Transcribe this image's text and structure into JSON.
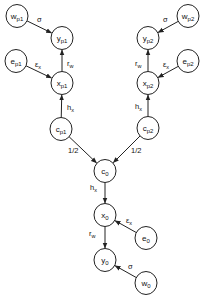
{
  "diagram": {
    "type": "directed-graph",
    "nodes": [
      {
        "id": "w_p1",
        "base": "w",
        "sub": "p1",
        "x": 17,
        "y": 16
      },
      {
        "id": "y_p1",
        "base": "y",
        "sub": "p1",
        "x": 62,
        "y": 38
      },
      {
        "id": "e_p1",
        "base": "e",
        "sub": "p1",
        "x": 16,
        "y": 61
      },
      {
        "id": "x_p1",
        "base": "x",
        "sub": "p1",
        "x": 62,
        "y": 83
      },
      {
        "id": "c_p1",
        "base": "c",
        "sub": "p1",
        "x": 61,
        "y": 129
      },
      {
        "id": "w_p2",
        "base": "w",
        "sub": "p2",
        "x": 188,
        "y": 16
      },
      {
        "id": "y_p2",
        "base": "y",
        "sub": "p2",
        "x": 148,
        "y": 38
      },
      {
        "id": "e_p2",
        "base": "e",
        "sub": "p2",
        "x": 188,
        "y": 61
      },
      {
        "id": "x_p2",
        "base": "x",
        "sub": "p2",
        "x": 148,
        "y": 83
      },
      {
        "id": "c_p2",
        "base": "c",
        "sub": "p2",
        "x": 148,
        "y": 128
      },
      {
        "id": "c_0",
        "base": "c",
        "sub": "0",
        "x": 105,
        "y": 171
      },
      {
        "id": "x_0",
        "base": "x",
        "sub": "0",
        "x": 105,
        "y": 215
      },
      {
        "id": "e_0",
        "base": "e",
        "sub": "0",
        "x": 146,
        "y": 238
      },
      {
        "id": "y_0",
        "base": "y",
        "sub": "0",
        "x": 105,
        "y": 260
      },
      {
        "id": "w_0",
        "base": "w",
        "sub": "0",
        "x": 146,
        "y": 283
      }
    ],
    "edges": [
      {
        "from": "w_p1",
        "to": "y_p1",
        "label": "σ",
        "label_sub": "",
        "lx": 37,
        "ly": 22
      },
      {
        "from": "e_p1",
        "to": "x_p1",
        "label": "ε",
        "label_sub": "x",
        "lx": 35,
        "ly": 67
      },
      {
        "from": "x_p1",
        "to": "y_p1",
        "label": "r",
        "label_sub": "w",
        "lx": 67,
        "ly": 66
      },
      {
        "from": "c_p1",
        "to": "x_p1",
        "label": "h",
        "label_sub": "x",
        "lx": 67,
        "ly": 110
      },
      {
        "from": "w_p2",
        "to": "y_p2",
        "label": "σ",
        "label_sub": "",
        "lx": 163,
        "ly": 22
      },
      {
        "from": "e_p2",
        "to": "x_p2",
        "label": "ε",
        "label_sub": "x",
        "lx": 163,
        "ly": 67
      },
      {
        "from": "x_p2",
        "to": "y_p2",
        "label": "r",
        "label_sub": "w",
        "lx": 135,
        "ly": 66
      },
      {
        "from": "c_p2",
        "to": "x_p2",
        "label": "h",
        "label_sub": "x",
        "lx": 135,
        "ly": 109
      },
      {
        "from": "c_p1",
        "to": "c_0",
        "label": "1/2",
        "label_sub": "",
        "lx": 68,
        "ly": 153
      },
      {
        "from": "c_p2",
        "to": "c_0",
        "label": "1/2",
        "label_sub": "",
        "lx": 131,
        "ly": 153
      },
      {
        "from": "c_0",
        "to": "x_0",
        "label": "h",
        "label_sub": "x",
        "lx": 90,
        "ly": 190
      },
      {
        "from": "e_0",
        "to": "x_0",
        "label": "ε",
        "label_sub": "x",
        "lx": 126,
        "ly": 223
      },
      {
        "from": "x_0",
        "to": "y_0",
        "label": "r",
        "label_sub": "w",
        "lx": 89,
        "ly": 236
      },
      {
        "from": "w_0",
        "to": "y_0",
        "label": "σ",
        "label_sub": "",
        "lx": 128,
        "ly": 269
      }
    ]
  },
  "style": {
    "stroke": "#222222",
    "background": "#ffffff",
    "node_rx": 11,
    "node_ry": 11.5
  }
}
